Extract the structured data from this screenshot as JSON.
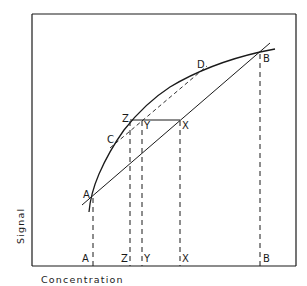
{
  "diagram": {
    "x_axis_label": "Concentration",
    "y_axis_label": "Signal",
    "colors": {
      "ink": "#1a1a1a",
      "background": "#ffffff"
    },
    "points": {
      "A": {
        "label": "A",
        "x": 92,
        "y": 196
      },
      "B": {
        "label": "B",
        "x": 260,
        "y": 52
      },
      "C": {
        "label": "C",
        "x": 115,
        "y": 143
      },
      "D": {
        "label": "D",
        "x": 205,
        "y": 67
      },
      "Z": {
        "label": "Z",
        "x": 131,
        "y": 120
      },
      "Y": {
        "label": "Y",
        "x": 142,
        "y": 120
      },
      "X": {
        "label": "X",
        "x": 180,
        "y": 120
      }
    },
    "axis_ticks": [
      {
        "label": "A",
        "x": 92
      },
      {
        "label": "Z",
        "x": 130
      },
      {
        "label": "Y",
        "x": 142
      },
      {
        "label": "X",
        "x": 180
      },
      {
        "label": "B",
        "x": 260
      }
    ]
  }
}
